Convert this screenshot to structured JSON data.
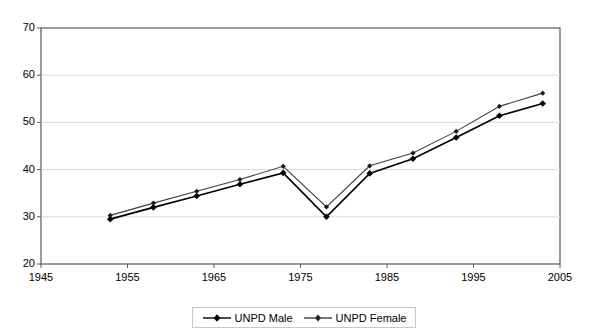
{
  "chart_data": {
    "type": "line",
    "title": "",
    "xlabel": "",
    "ylabel": "",
    "xlim": [
      1945,
      2005
    ],
    "ylim": [
      20,
      70
    ],
    "xticks": [
      1945,
      1955,
      1965,
      1975,
      1985,
      1995,
      2005
    ],
    "yticks": [
      20,
      30,
      40,
      50,
      60,
      70
    ],
    "grid": "horizontal",
    "legend_position": "bottom-center",
    "x": [
      1953,
      1958,
      1963,
      1968,
      1973,
      1978,
      1983,
      1988,
      1993,
      1998,
      2003
    ],
    "series": [
      {
        "name": "UNPD Male",
        "marker": "diamond",
        "color": "#000000",
        "values": [
          29.5,
          32.0,
          34.4,
          36.9,
          39.3,
          30.0,
          39.2,
          42.3,
          46.8,
          51.4,
          54.0
        ]
      },
      {
        "name": "UNPD Female",
        "marker": "diamond",
        "color": "#404040",
        "values": [
          30.3,
          32.9,
          35.4,
          37.9,
          40.7,
          32.1,
          40.8,
          43.5,
          48.1,
          53.4,
          56.2
        ]
      }
    ]
  },
  "legend": {
    "items": [
      {
        "label": "UNPD Male"
      },
      {
        "label": "UNPD Female"
      }
    ]
  },
  "axes": {
    "y_tick_labels": [
      "70",
      "60",
      "50",
      "40",
      "30",
      "20"
    ],
    "x_tick_labels": [
      "1945",
      "1955",
      "1965",
      "1975",
      "1985",
      "1995",
      "2005"
    ]
  }
}
